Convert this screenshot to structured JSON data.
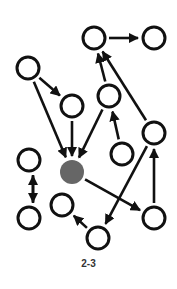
{
  "caption": "2-3",
  "colors": {
    "stroke": "#111111",
    "highlight_fill": "#666666",
    "node_fill": "#ffffff"
  },
  "nodes": [
    {
      "id": "A",
      "x": 94,
      "y": 38,
      "highlight": false
    },
    {
      "id": "B",
      "x": 154,
      "y": 38,
      "highlight": false
    },
    {
      "id": "C",
      "x": 28,
      "y": 68,
      "highlight": false
    },
    {
      "id": "D",
      "x": 72,
      "y": 106,
      "highlight": false
    },
    {
      "id": "E",
      "x": 109,
      "y": 96,
      "highlight": false
    },
    {
      "id": "F",
      "x": 154,
      "y": 133,
      "highlight": false
    },
    {
      "id": "G",
      "x": 122,
      "y": 154,
      "highlight": false
    },
    {
      "id": "H",
      "x": 72,
      "y": 172,
      "highlight": true
    },
    {
      "id": "I",
      "x": 29,
      "y": 160,
      "highlight": false
    },
    {
      "id": "J",
      "x": 29,
      "y": 218,
      "highlight": false
    },
    {
      "id": "K",
      "x": 62,
      "y": 205,
      "highlight": false
    },
    {
      "id": "L",
      "x": 154,
      "y": 218,
      "highlight": false
    },
    {
      "id": "M",
      "x": 98,
      "y": 238,
      "highlight": false
    }
  ],
  "edges": [
    {
      "from": "A",
      "to": "B"
    },
    {
      "from": "E",
      "to": "A"
    },
    {
      "from": "F",
      "to": "A"
    },
    {
      "from": "C",
      "to": "D"
    },
    {
      "from": "C",
      "to": "H"
    },
    {
      "from": "D",
      "to": "H"
    },
    {
      "from": "E",
      "to": "H"
    },
    {
      "from": "G",
      "to": "E"
    },
    {
      "from": "H",
      "to": "L"
    },
    {
      "from": "F",
      "to": "M"
    },
    {
      "from": "L",
      "to": "F"
    },
    {
      "from": "M",
      "to": "K"
    },
    {
      "from": "I",
      "to": "J",
      "offset": 4
    },
    {
      "from": "J",
      "to": "I",
      "offset": 4
    }
  ]
}
